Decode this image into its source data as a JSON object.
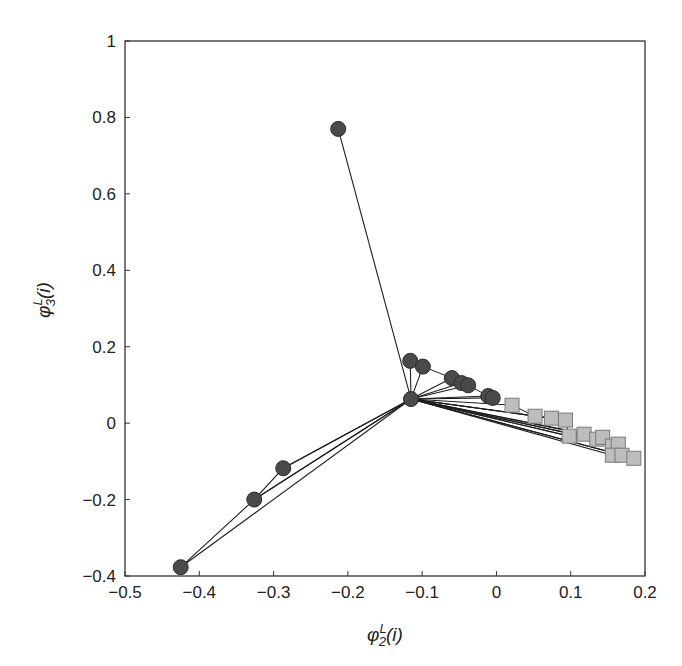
{
  "chart_data": {
    "type": "scatter",
    "title": "",
    "xlabel": "φ^L_2(i)",
    "ylabel": "φ^L_3(i)",
    "xlabel_parts": {
      "base": "φ",
      "sup": "L",
      "sub": "2",
      "arg": "(i)"
    },
    "ylabel_parts": {
      "base": "φ",
      "sup": "L",
      "sub": "3",
      "arg": "(i)"
    },
    "xlim": [
      -0.5,
      0.2
    ],
    "ylim": [
      -0.4,
      1.0
    ],
    "xticks": [
      -0.5,
      -0.4,
      -0.3,
      -0.2,
      -0.1,
      0,
      0.1,
      0.2
    ],
    "xtick_labels": [
      "−0.5",
      "−0.4",
      "−0.3",
      "−0.2",
      "−0.1",
      "0",
      "0.1",
      "0.2"
    ],
    "yticks": [
      -0.4,
      -0.2,
      0,
      0.2,
      0.4,
      0.6,
      0.8,
      1.0
    ],
    "ytick_labels": [
      "−0.4",
      "−0.2",
      "0",
      "0.2",
      "0.4",
      "0.6",
      "0.8",
      "1"
    ],
    "grid": false,
    "legend": null,
    "hub": {
      "x": -0.115,
      "y": 0.063
    },
    "series": [
      {
        "name": "circles",
        "marker": "circle",
        "color": "#4a4a4a",
        "points": [
          {
            "x": -0.115,
            "y": 0.063
          },
          {
            "x": -0.213,
            "y": 0.77
          },
          {
            "x": -0.425,
            "y": -0.377
          },
          {
            "x": -0.326,
            "y": -0.2
          },
          {
            "x": -0.287,
            "y": -0.118
          },
          {
            "x": -0.116,
            "y": 0.163
          },
          {
            "x": -0.099,
            "y": 0.148
          },
          {
            "x": -0.06,
            "y": 0.118
          },
          {
            "x": -0.047,
            "y": 0.105
          },
          {
            "x": -0.038,
            "y": 0.099
          },
          {
            "x": -0.011,
            "y": 0.071
          },
          {
            "x": -0.005,
            "y": 0.066
          }
        ]
      },
      {
        "name": "squares",
        "marker": "square",
        "color": "#bdbdbd",
        "points": [
          {
            "x": 0.021,
            "y": 0.047
          },
          {
            "x": 0.052,
            "y": 0.018
          },
          {
            "x": 0.074,
            "y": 0.013
          },
          {
            "x": 0.093,
            "y": 0.008
          },
          {
            "x": 0.098,
            "y": -0.034
          },
          {
            "x": 0.118,
            "y": -0.029
          },
          {
            "x": 0.135,
            "y": -0.042
          },
          {
            "x": 0.143,
            "y": -0.037
          },
          {
            "x": 0.156,
            "y": -0.06
          },
          {
            "x": 0.164,
            "y": -0.055
          },
          {
            "x": 0.156,
            "y": -0.084
          },
          {
            "x": 0.169,
            "y": -0.084
          },
          {
            "x": 0.185,
            "y": -0.092
          }
        ]
      }
    ],
    "edges": [
      [
        [
          -0.425,
          -0.377
        ],
        [
          -0.326,
          -0.2
        ]
      ],
      [
        [
          -0.326,
          -0.2
        ],
        [
          -0.115,
          0.063
        ]
      ],
      [
        [
          -0.287,
          -0.118
        ],
        [
          -0.115,
          0.063
        ]
      ],
      [
        [
          -0.326,
          -0.2
        ],
        [
          -0.287,
          -0.118
        ]
      ]
    ],
    "colors": {
      "circle_fill": "#4a4a4a",
      "circle_stroke": "#2b2b2b",
      "square_fill": "#bdbdbd",
      "square_stroke": "#7a7a7a",
      "line": "#1e1e1e",
      "axis": "#333333"
    }
  }
}
